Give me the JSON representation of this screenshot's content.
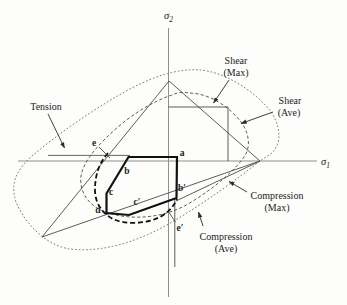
{
  "axes": {
    "sigma1": {
      "base": "σ",
      "sub": "1"
    },
    "sigma2": {
      "base": "σ",
      "sub": "2"
    }
  },
  "annotations": {
    "tension": "Tension",
    "shear_max": {
      "line1": "Shear",
      "line2": "(Max)"
    },
    "shear_ave": {
      "line1": "Shear",
      "line2": "(Ave)"
    },
    "compression_max": {
      "line1": "Compression",
      "line2": "(Max)"
    },
    "compression_ave": {
      "line1": "Compression",
      "line2": "(Ave)"
    }
  },
  "points": {
    "a": "a",
    "b": "b",
    "c": "c",
    "d": "d",
    "e": "e",
    "b_prime": "b′",
    "c_prime": "c′",
    "e_prime": "e′"
  },
  "colors": {
    "ink": "#1c1c1c",
    "axis_gray": "#8f8f8f",
    "thin_line": "#4a4a4a",
    "dotted_curve": "#767676",
    "dashed_curve": "#555555",
    "background": "#fdfdfb"
  }
}
